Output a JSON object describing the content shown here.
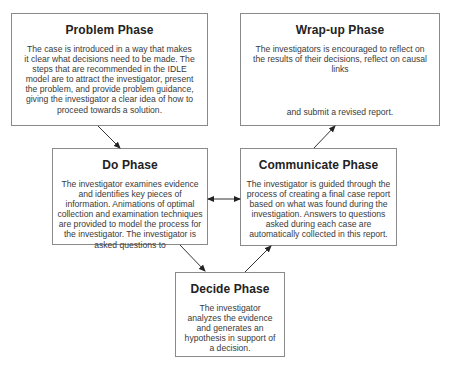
{
  "diagram": {
    "colors": {
      "border": "#8a8a8a",
      "arrow": "#222222",
      "text": "#3a3a3a",
      "title": "#222222"
    },
    "nodes": {
      "problem": {
        "title": "Problem Phase",
        "text": "The case is introduced in a way that makes it clear what decisions need to be made. The steps that are recommended in the IDLE model are to attract the investigator, present the problem, and provide problem guidance, giving the investigator a clear idea of how to proceed towards a solution."
      },
      "wrapup": {
        "title": "Wrap-up Phase",
        "text": "The investigators is encouraged to reflect on the results of their decisions, reflect on causal links",
        "text_tail": "and submit a revised report."
      },
      "do": {
        "title": "Do Phase",
        "text": "The investigator examines evidence and identifies key pieces of information. Animations of optimal collection and examination techniques are provided to model the process for the investigator. The investigator is asked questions to"
      },
      "communicate": {
        "title": "Communicate Phase",
        "text": "The investigator is guided through the process of creating a final case report based on what was found during the investigation. Answers to questions asked during each case are automatically collected in this report."
      },
      "decide": {
        "title": "Decide Phase",
        "text": "The investigator analyzes the evidence and generates an hypothesis in support of a decision."
      }
    },
    "edges": [
      {
        "from": "problem",
        "to": "do",
        "type": "arrow"
      },
      {
        "from": "do",
        "to": "communicate",
        "type": "bidirectional"
      },
      {
        "from": "do",
        "to": "decide",
        "type": "arrow"
      },
      {
        "from": "decide",
        "to": "communicate",
        "type": "arrow"
      },
      {
        "from": "communicate",
        "to": "wrapup",
        "type": "arrow"
      }
    ]
  }
}
